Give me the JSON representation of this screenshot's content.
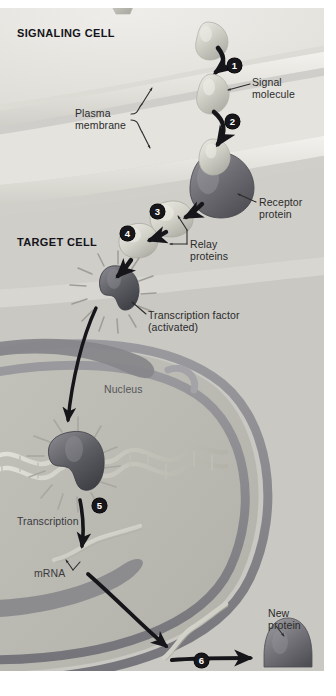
{
  "figure": {
    "background_color": "#d6d5d1",
    "text_color": "#2b2b2b"
  },
  "cell_labels": [
    {
      "id": "signaling-cell",
      "text": "SIGNALING CELL",
      "x": 17,
      "y": 19
    },
    {
      "id": "target-cell",
      "text": "TARGET CELL",
      "x": 17,
      "y": 228
    }
  ],
  "steps": [
    {
      "number": "1",
      "x": 227,
      "y": 50
    },
    {
      "number": "2",
      "x": 225,
      "y": 106
    },
    {
      "number": "3",
      "x": 150,
      "y": 196
    },
    {
      "number": "4",
      "x": 120,
      "y": 218
    },
    {
      "number": "5",
      "x": 92,
      "y": 490
    },
    {
      "number": "6",
      "x": 194,
      "y": 645
    }
  ],
  "annotations": [
    {
      "id": "signal-molecule",
      "text": "Signal\nmolecule",
      "x": 252,
      "y": 69
    },
    {
      "id": "plasma-membrane",
      "text": "Plasma\nmembrane",
      "x": 75,
      "y": 100
    },
    {
      "id": "receptor-protein",
      "text": "Receptor\nprotein",
      "x": 259,
      "y": 189
    },
    {
      "id": "relay-proteins",
      "text": "Relay\nproteins",
      "x": 190,
      "y": 231
    },
    {
      "id": "transcription-factor",
      "text": "Transcription factor\n(activated)",
      "x": 148,
      "y": 302
    },
    {
      "id": "nucleus",
      "text": "Nucleus",
      "x": 104,
      "y": 376
    },
    {
      "id": "transcription",
      "text": "Transcription",
      "x": 17,
      "y": 508
    },
    {
      "id": "mrna",
      "text": "mRNA",
      "x": 34,
      "y": 560
    },
    {
      "id": "translation",
      "text": "Translation",
      "x": 200,
      "y": 664
    },
    {
      "id": "new-protein",
      "text": "New\nprotein",
      "x": 268,
      "y": 600
    }
  ],
  "structures": {
    "signal_molecule_color": "#c7c6bd",
    "receptor_protein_color": "#6e6e72",
    "relay_protein_color": "#cfcec6",
    "transcription_factor_color": "#5d5d63",
    "new_protein_color": "#7a7a7e",
    "nuclear_envelope_color": "#8e8e92",
    "dna_color": "#c9c8c0",
    "mrna_color": "#cfcdc4",
    "arrow_color": "#111114",
    "leader_color": "#2b2b2b"
  },
  "diagram_data": {
    "type": "process-diagram",
    "stages": [
      {
        "step": "1",
        "label": "Signal molecule released from signaling cell",
        "region": "extracellular"
      },
      {
        "step": "2",
        "label": "Signal molecule binds receptor protein",
        "region": "plasma membrane"
      },
      {
        "step": "3",
        "label": "Relay protein activated",
        "region": "cytoplasm"
      },
      {
        "step": "4",
        "label": "Second relay protein activates transcription factor",
        "region": "cytoplasm"
      },
      {
        "step": "5",
        "label": "Transcription of DNA produces mRNA",
        "region": "nucleus"
      },
      {
        "step": "6",
        "label": "Translation of mRNA produces new protein",
        "region": "cytoplasm"
      }
    ]
  }
}
